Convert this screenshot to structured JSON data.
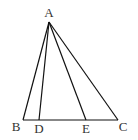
{
  "diagram": {
    "type": "triangle-with-cevians",
    "points": {
      "A": {
        "label": "A",
        "x": 49,
        "y": 22,
        "lx": 49,
        "ly": 17
      },
      "B": {
        "label": "B",
        "x": 23,
        "y": 120,
        "lx": 16,
        "ly": 131
      },
      "D": {
        "label": "D",
        "x": 39,
        "y": 120,
        "lx": 39,
        "ly": 133
      },
      "E": {
        "label": "E",
        "x": 86,
        "y": 120,
        "lx": 86,
        "ly": 133
      },
      "C": {
        "label": "C",
        "x": 118,
        "y": 120,
        "lx": 123,
        "ly": 131
      }
    },
    "segments": [
      "AB",
      "AD",
      "AE",
      "AC",
      "BC"
    ]
  }
}
